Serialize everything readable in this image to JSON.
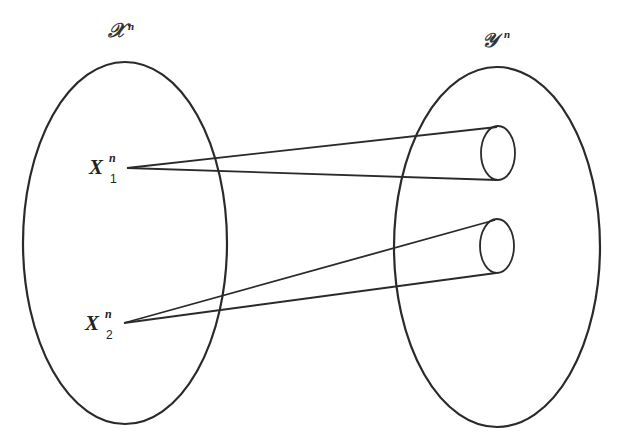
{
  "diagram": {
    "left_set": {
      "label": "𝒳",
      "superscript": "n"
    },
    "right_set": {
      "label": "𝒴",
      "superscript": "n"
    },
    "points": [
      {
        "base": "X",
        "superscript": "n",
        "subscript": "1"
      },
      {
        "base": "X",
        "superscript": "n",
        "subscript": "2"
      }
    ]
  },
  "colors": {
    "stroke": "#2a2a2a",
    "background": "#ffffff"
  }
}
